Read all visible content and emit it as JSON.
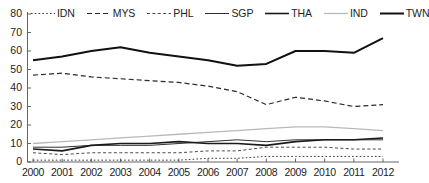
{
  "chart_data": {
    "type": "line",
    "title": "",
    "xlabel": "",
    "ylabel": "",
    "x": [
      2000,
      2001,
      2002,
      2003,
      2004,
      2005,
      2006,
      2007,
      2008,
      2009,
      2010,
      2011,
      2012
    ],
    "xtick_labels": [
      "2000",
      "2001",
      "2002",
      "2003",
      "2004",
      "2005",
      "2006",
      "2007",
      "2008",
      "2009",
      "2010",
      "2011",
      "2012"
    ],
    "ytick_labels": [
      "0",
      "10",
      "20",
      "30",
      "40",
      "50",
      "60",
      "70",
      "80"
    ],
    "ytick_values": [
      0,
      10,
      20,
      30,
      40,
      50,
      60,
      70,
      80
    ],
    "ylim": [
      0,
      80
    ],
    "xlim": [
      2000,
      2012
    ],
    "grid": false,
    "legend_position": "top",
    "series": [
      {
        "name": "IDN",
        "label": "IDN",
        "style": "dotted",
        "color": "#3a3a3a",
        "width": 1.0,
        "dash": "1.6,2.2",
        "values": [
          1,
          1,
          1,
          1,
          1,
          1,
          2,
          2,
          3,
          3,
          3,
          3,
          3
        ]
      },
      {
        "name": "MYS",
        "label": "MYS",
        "style": "dashed",
        "color": "#2b2b2b",
        "width": 1.2,
        "dash": "5,3",
        "values": [
          47,
          48,
          46,
          45,
          44,
          43,
          41,
          38,
          31,
          35,
          33,
          30,
          31
        ]
      },
      {
        "name": "PHL",
        "label": "PHL",
        "style": "fine-dashed",
        "color": "#4a4a4a",
        "width": 1.0,
        "dash": "3,2.4",
        "values": [
          5,
          4,
          5,
          5,
          5,
          5,
          6,
          6,
          8,
          8,
          8,
          7,
          7
        ]
      },
      {
        "name": "SGP",
        "label": "SGP",
        "style": "solid-thin",
        "color": "#303030",
        "width": 1.0,
        "dash": "",
        "values": [
          8,
          8,
          9,
          9,
          9,
          10,
          11,
          12,
          11,
          12,
          12,
          12,
          12
        ]
      },
      {
        "name": "THA",
        "label": "THA",
        "style": "solid-medium",
        "color": "#1a1a1a",
        "width": 1.6,
        "dash": "",
        "values": [
          7,
          6,
          9,
          10,
          10,
          11,
          10,
          10,
          9,
          11,
          12,
          12,
          13
        ]
      },
      {
        "name": "IND",
        "label": "IND",
        "style": "solid-light",
        "color": "#b9b9b9",
        "width": 1.3,
        "dash": "",
        "values": [
          10,
          11,
          12,
          13,
          14,
          15,
          16,
          17,
          18,
          19,
          19,
          18,
          17
        ]
      },
      {
        "name": "TWN",
        "label": "TWN",
        "style": "solid-thick",
        "color": "#111111",
        "width": 2.0,
        "dash": "",
        "values": [
          55,
          57,
          60,
          62,
          59,
          57,
          55,
          52,
          53,
          60,
          60,
          59,
          67
        ]
      }
    ]
  },
  "axis": {
    "line_color": "#555555"
  }
}
